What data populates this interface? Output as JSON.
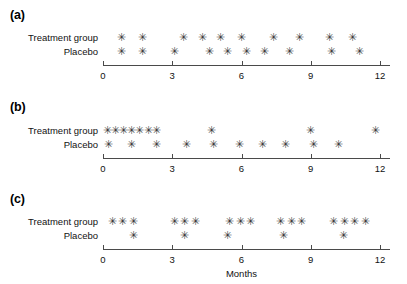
{
  "figure": {
    "width": 407,
    "height": 284,
    "axis_title": "Months",
    "mark_glyph": "✳",
    "mark_color": "#3a3a3a",
    "axis_color": "#4a4a4a",
    "text_color": "#111111"
  },
  "axis": {
    "tick_values": [
      0,
      3,
      6,
      9,
      12
    ],
    "tick_labels": [
      "0",
      "3",
      "6",
      "9",
      "12"
    ],
    "xmin": 0,
    "xmax": 12,
    "px_at_xmin": 103,
    "px_at_xmax": 380,
    "line_end_px": 390
  },
  "labels": {
    "treatment": "Treatment group",
    "placebo": "Placebo"
  },
  "panels": [
    {
      "letter": "(a)",
      "top": 6,
      "letter_y": 8,
      "treatment_y": 33,
      "placebo_y": 47,
      "axis_y": 65,
      "tick_label_y": 70,
      "series": [
        {
          "name": "Treatment group",
          "marks": [
            0.8,
            1.7,
            3.5,
            4.3,
            5.1,
            6.0,
            7.4,
            8.5,
            9.8,
            10.8
          ]
        },
        {
          "name": "Placebo",
          "marks": [
            0.8,
            1.7,
            3.1,
            4.6,
            5.4,
            6.2,
            7.0,
            8.1,
            9.9,
            11.1
          ]
        }
      ]
    },
    {
      "letter": "(b)",
      "top": 98,
      "letter_y": 100,
      "treatment_y": 126,
      "placebo_y": 140,
      "axis_y": 158,
      "tick_label_y": 163,
      "series": [
        {
          "name": "Treatment group",
          "marks": [
            0.2,
            0.55,
            0.9,
            1.25,
            1.6,
            1.95,
            2.3,
            4.7,
            9.0,
            11.8
          ]
        },
        {
          "name": "Placebo",
          "marks": [
            0.25,
            1.25,
            2.3,
            3.6,
            4.8,
            5.9,
            6.9,
            7.9,
            9.1,
            10.2
          ]
        }
      ]
    },
    {
      "letter": "(c)",
      "top": 190,
      "letter_y": 192,
      "treatment_y": 217,
      "placebo_y": 231,
      "axis_y": 249,
      "tick_label_y": 254,
      "axis_title_y": 268,
      "series": [
        {
          "name": "Treatment group",
          "marks": [
            0.4,
            0.85,
            1.3,
            3.1,
            3.55,
            4.0,
            5.5,
            5.95,
            6.4,
            7.7,
            8.15,
            8.6,
            10.0,
            10.45,
            10.9,
            11.35
          ]
        },
        {
          "name": "Placebo",
          "marks": [
            1.3,
            3.55,
            5.4,
            7.8,
            10.4
          ]
        }
      ]
    }
  ]
}
